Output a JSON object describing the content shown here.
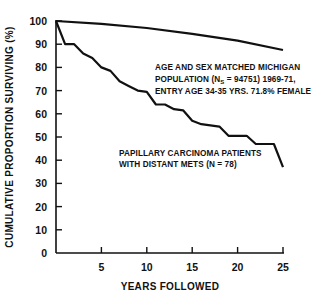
{
  "chart_data": {
    "type": "line",
    "title": "",
    "xlabel": "YEARS FOLLOWED",
    "ylabel": "CUMULATIVE PROPORTION SURVIVING (%)",
    "xlim": [
      0,
      25
    ],
    "ylim": [
      0,
      100
    ],
    "x_ticks": [
      5,
      10,
      15,
      20,
      25
    ],
    "y_ticks": [
      0,
      10,
      20,
      30,
      40,
      50,
      60,
      70,
      80,
      90,
      100
    ],
    "grid": false,
    "legend": null,
    "series": [
      {
        "name": "Age and sex matched Michigan population",
        "x": [
          0,
          5,
          10,
          15,
          20,
          25
        ],
        "values": [
          100,
          98.8,
          97,
          94.5,
          91.5,
          87.5
        ]
      },
      {
        "name": "Papillary carcinoma patients with distant mets",
        "x": [
          0,
          1,
          2,
          3,
          4,
          5,
          6,
          7,
          8,
          9,
          10,
          11,
          12,
          13,
          14,
          15,
          16,
          17,
          18,
          19,
          20,
          21,
          22,
          23,
          24,
          25
        ],
        "values": [
          100,
          90,
          90,
          86,
          84,
          80,
          78.5,
          74,
          72,
          70,
          69.5,
          64,
          64,
          62,
          61.5,
          57,
          55.5,
          55,
          54.5,
          50.5,
          50.5,
          50.5,
          47,
          47,
          47,
          37
        ]
      }
    ],
    "annotations": [
      {
        "lines": [
          "AGE AND SEX MATCHED MICHIGAN",
          "POPULATION (N",
          "S",
          " = 94751) 1969-71,",
          "ENTRY AGE 34-35 YRS. 71.8% FEMALE"
        ]
      },
      {
        "lines": [
          "PAPILLARY CARCINOMA PATIENTS",
          "WITH DISTANT METS (N = 78)"
        ]
      }
    ]
  },
  "labels": {
    "xlabel": "YEARS FOLLOWED",
    "ylabel": "CUMULATIVE PROPORTION SURVIVING (%)",
    "y_ticks": [
      "0",
      "10",
      "20",
      "30",
      "40",
      "50",
      "60",
      "70",
      "80",
      "90",
      "100"
    ],
    "x_ticks": [
      "5",
      "10",
      "15",
      "20",
      "25"
    ],
    "pop_line1": "AGE AND SEX MATCHED MICHIGAN",
    "pop_line2a": "POPULATION (N",
    "pop_line2sub": "S",
    "pop_line2b": " = 94751) 1969-71,",
    "pop_line3": "ENTRY AGE 34-35 YRS. 71.8% FEMALE",
    "pap_line1": "PAPILLARY CARCINOMA PATIENTS",
    "pap_line2": "WITH DISTANT METS (N = 78)"
  }
}
